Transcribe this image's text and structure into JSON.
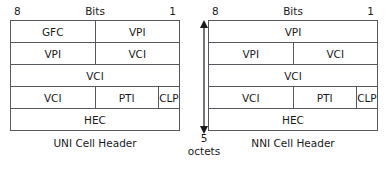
{
  "diagram": {
    "octet_marker": {
      "count": "5",
      "unit": "octets",
      "icon": "double-headed-vertical-arrow-icon"
    },
    "panels": [
      {
        "id": "uni",
        "caption": "UNI Cell Header",
        "ruler": {
          "left": "8",
          "middle": "Bits",
          "right": "1"
        },
        "rows": [
          {
            "cells": [
              {
                "label": "GFC",
                "span": 4
              },
              {
                "label": "VPI",
                "span": 4
              }
            ]
          },
          {
            "cells": [
              {
                "label": "VPI",
                "span": 4
              },
              {
                "label": "VCI",
                "span": 4
              }
            ]
          },
          {
            "cells": [
              {
                "label": "VCI",
                "span": 8
              }
            ]
          },
          {
            "cells": [
              {
                "label": "VCI",
                "span": 4
              },
              {
                "label": "PTI",
                "span": 3
              },
              {
                "label": "CLP",
                "span": 1
              }
            ]
          },
          {
            "cells": [
              {
                "label": "HEC",
                "span": 8
              }
            ]
          }
        ]
      },
      {
        "id": "nni",
        "caption": "NNI Cell Header",
        "ruler": {
          "left": "8",
          "middle": "Bits",
          "right": "1"
        },
        "rows": [
          {
            "cells": [
              {
                "label": "VPI",
                "span": 8
              }
            ]
          },
          {
            "cells": [
              {
                "label": "VPI",
                "span": 4
              },
              {
                "label": "VCI",
                "span": 4
              }
            ]
          },
          {
            "cells": [
              {
                "label": "VCI",
                "span": 8
              }
            ]
          },
          {
            "cells": [
              {
                "label": "VCI",
                "span": 4
              },
              {
                "label": "PTI",
                "span": 3
              },
              {
                "label": "CLP",
                "span": 1
              }
            ]
          },
          {
            "cells": [
              {
                "label": "HEC",
                "span": 8
              }
            ]
          }
        ]
      }
    ]
  },
  "colors": {
    "background": "#ffffff",
    "line": "#55585c",
    "text": "#1a1a1a"
  }
}
